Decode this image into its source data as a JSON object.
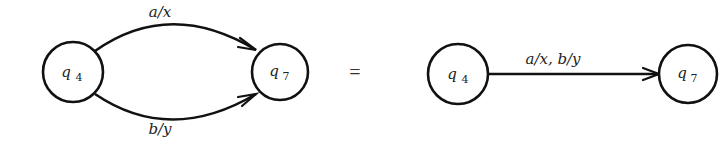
{
  "diagram": {
    "left": {
      "states": [
        {
          "id": "q4",
          "name": "q",
          "subscript": "4"
        },
        {
          "id": "q7",
          "name": "q",
          "subscript": "7"
        }
      ],
      "transitions": [
        {
          "from": "q4",
          "to": "q7",
          "label": "a/x"
        },
        {
          "from": "q4",
          "to": "q7",
          "label": "b/y"
        }
      ]
    },
    "equals_sign": "=",
    "right": {
      "states": [
        {
          "id": "q4",
          "name": "q",
          "subscript": "4"
        },
        {
          "id": "q7",
          "name": "q",
          "subscript": "7"
        }
      ],
      "transitions": [
        {
          "from": "q4",
          "to": "q7",
          "label": "a/x, b/y"
        }
      ]
    },
    "colors": {
      "stroke": "#111111",
      "text": "#222222",
      "background": "#ffffff"
    }
  }
}
